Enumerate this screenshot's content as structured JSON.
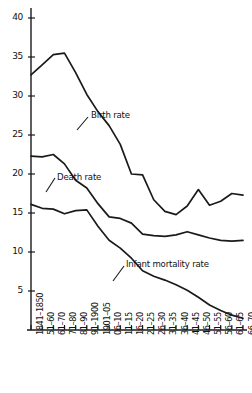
{
  "chart_data": {
    "type": "line",
    "title": "",
    "subtitle": "",
    "xlabel": "",
    "ylabel": "",
    "grid": false,
    "legend_position": "inline-annotations",
    "ylim": [
      0,
      42
    ],
    "yticks": [
      5,
      10,
      15,
      20,
      25,
      30,
      35,
      40
    ],
    "categories": [
      "1841–1850",
      "51–60",
      "61–70",
      "71–80",
      "81–90",
      "91–1900",
      "1901–05",
      "06–10",
      "11–15",
      "16–20",
      "21–25",
      "26–30",
      "31–35",
      "36–40",
      "41–45",
      "46–50",
      "51–55",
      "56–60",
      "61–65",
      "66–70"
    ],
    "series": [
      {
        "name": "Birth rate",
        "label": "Birth rate",
        "color": "#1a1a1a",
        "values": [
          32.7,
          34.0,
          35.3,
          35.5,
          33.0,
          30.2,
          28.0,
          26.2,
          23.8,
          20.0,
          19.9,
          16.7,
          15.2,
          14.8,
          15.9,
          18.0,
          16.0,
          16.5,
          17.5,
          17.3
        ]
      },
      {
        "name": "Death rate",
        "label": "Death rate",
        "color": "#1a1a1a",
        "values": [
          22.3,
          22.2,
          22.5,
          21.3,
          19.2,
          18.2,
          16.2,
          14.5,
          14.3,
          13.7,
          12.3,
          12.1,
          12.0,
          12.2,
          12.6,
          12.2,
          11.8,
          11.5,
          11.4,
          11.5
        ]
      },
      {
        "name": "Infant mortality rate",
        "label": "Infant mortality rate",
        "color": "#1a1a1a",
        "values": [
          16.1,
          15.6,
          15.5,
          14.9,
          15.3,
          15.4,
          13.3,
          11.5,
          10.5,
          9.2,
          7.6,
          6.9,
          6.4,
          5.8,
          5.1,
          4.2,
          3.2,
          2.5,
          1.9,
          1.5
        ]
      }
    ],
    "annotations": [
      {
        "text": "Birth rate",
        "x_px": 91,
        "y_px": 110
      },
      {
        "text": "Death rate",
        "x_px": 57,
        "y_px": 172
      },
      {
        "text": "Infant mortality rate",
        "x_px": 126,
        "y_px": 259
      }
    ],
    "axis": {
      "x_left_px": 31,
      "x_right_px": 243,
      "y_zero_px": 330,
      "y_top_px": 8,
      "px_per_unit": 7.8,
      "line_color": "#1a1a1a"
    }
  }
}
